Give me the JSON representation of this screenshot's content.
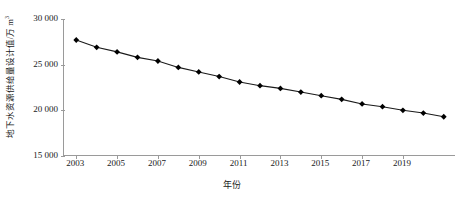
{
  "chart_data": {
    "type": "line",
    "title": "",
    "subtitle": "",
    "xlabel": "年份",
    "ylabel": "地下水资源供给量设计值/万 m³",
    "ylabel_main": "地下水资源供给量设计值/万 m",
    "ylabel_sup": "3",
    "xlim": [
      2002.4,
      2021.6
    ],
    "ylim": [
      15000,
      30000
    ],
    "grid": false,
    "legend": null,
    "marker": "diamond",
    "marker_color": "#000000",
    "line_color": "#1a1a1a",
    "axis_color": "#9a9a9a",
    "yticks": [
      15000,
      20000,
      25000,
      30000
    ],
    "ytick_labels": [
      "15 000",
      "20 000",
      "25 000",
      "30 000"
    ],
    "xticks": [
      2003,
      2005,
      2007,
      2009,
      2011,
      2013,
      2015,
      2017,
      2019
    ],
    "xtick_labels": [
      "2003",
      "2005",
      "2007",
      "2009",
      "2011",
      "2013",
      "2015",
      "2017",
      "2019"
    ],
    "x": [
      2003,
      2004,
      2005,
      2006,
      2007,
      2008,
      2009,
      2010,
      2011,
      2012,
      2013,
      2014,
      2015,
      2016,
      2017,
      2018,
      2019,
      2020,
      2021
    ],
    "values": [
      27700,
      26900,
      26400,
      25800,
      25400,
      24700,
      24200,
      23700,
      23100,
      22700,
      22400,
      22000,
      21600,
      21200,
      20700,
      20400,
      20000,
      19700,
      19300
    ],
    "series": [
      {
        "name": "地下水资源供给量设计值",
        "values": [
          27700,
          26900,
          26400,
          25800,
          25400,
          24700,
          24200,
          23700,
          23100,
          22700,
          22400,
          22000,
          21600,
          21200,
          20700,
          20400,
          20000,
          19700,
          19300
        ]
      }
    ]
  }
}
